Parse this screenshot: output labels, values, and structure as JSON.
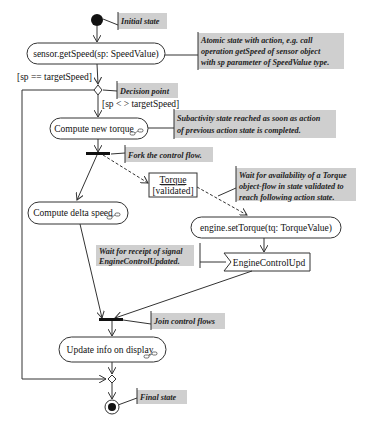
{
  "diagram": {
    "type": "UML activity diagram",
    "nodes": {
      "initial": {
        "label": ""
      },
      "get_speed": {
        "label": "sensor.getSpeed(sp: SpeedValue)"
      },
      "compute_torque": {
        "label": "Compute new torque"
      },
      "torque_object": {
        "name": "Torque",
        "state": "[validated]"
      },
      "compute_delta": {
        "label": "Compute delta speed"
      },
      "set_torque": {
        "label": "engine.setTorque(tq: TorqueValue)"
      },
      "signal": {
        "label": "EngineControlUpd"
      },
      "update_display": {
        "label": "Update info on display"
      }
    },
    "guards": {
      "equal": "[sp == targetSpeed]",
      "not_equal": "[sp < > targetSpeed]"
    },
    "notes": {
      "initial": [
        "Initial state"
      ],
      "atomic": [
        "Atomic state with action, e.g. call",
        "operation getSpeed of sensor object",
        "with sp parameter of SpeedValue type."
      ],
      "decision": [
        "Decision point"
      ],
      "subactivity": [
        "Subactivity state reached as soon as action",
        "of previous action state is completed."
      ],
      "fork": [
        "Fork the control flow."
      ],
      "object_flow": [
        "Wait for availability of a Torque",
        "object-flow in state validated to",
        "reach following action state."
      ],
      "signal": [
        "Wait for receipt of signal",
        "EngineControlUpdated."
      ],
      "join": [
        "Join control flows"
      ],
      "final": [
        "Final state"
      ]
    }
  }
}
